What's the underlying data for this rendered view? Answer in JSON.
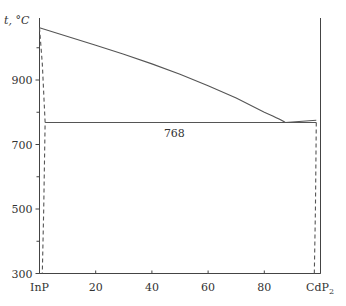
{
  "chart_data": {
    "type": "line",
    "title": "",
    "subtitle": "InP–CdP2 phase diagram",
    "xlabel": "",
    "ylabel": "t, °C",
    "x_left_label": "InP",
    "x_right_label": "CdP",
    "x_right_label_sub": "2",
    "xlim": [
      0,
      100
    ],
    "ylim": [
      300,
      1080
    ],
    "xticks": [
      0,
      20,
      40,
      60,
      80,
      100
    ],
    "xtick_labels": [
      "InP",
      "20",
      "40",
      "60",
      "80",
      "CdP2"
    ],
    "yticks": [
      300,
      500,
      700,
      900
    ],
    "yticks_minor": [
      400,
      600,
      800,
      1000
    ],
    "ytick_labels": [
      "300",
      "500",
      "700",
      "900"
    ],
    "grid": false,
    "legend": null,
    "annotations": [
      {
        "text": "768",
        "x": 48,
        "y": 768,
        "note": "eutectic temperature"
      }
    ],
    "series": [
      {
        "name": "liquidus",
        "style": "solid",
        "x": [
          0,
          10,
          20,
          30,
          40,
          50,
          60,
          70,
          80,
          85,
          87.5
        ],
        "y": [
          1062,
          1035,
          1008,
          980,
          950,
          918,
          882,
          844,
          800,
          780,
          768
        ]
      },
      {
        "name": "eutectic line",
        "style": "solid",
        "x": [
          2,
          87.5,
          98.5
        ],
        "y": [
          768,
          768,
          768
        ]
      },
      {
        "name": "CdP2 side liquidus",
        "style": "solid",
        "x": [
          87.5,
          98.5
        ],
        "y": [
          768,
          775
        ]
      },
      {
        "name": "CdP2 vertical",
        "style": "solid",
        "x": [
          100,
          100
        ],
        "y": [
          300,
          1085
        ]
      },
      {
        "name": "InP solvus",
        "style": "dashed",
        "x": [
          0,
          1,
          2,
          1.5,
          1.0
        ],
        "y": [
          1062,
          950,
          768,
          500,
          300
        ]
      },
      {
        "name": "CdP2 solvus",
        "style": "dashed",
        "x": [
          98.5,
          98.2,
          97.8
        ],
        "y": [
          768,
          500,
          300
        ]
      }
    ]
  }
}
